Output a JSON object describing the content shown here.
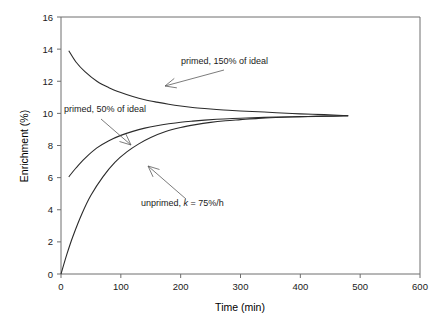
{
  "chart_data": {
    "type": "line",
    "title": "",
    "xlabel": "Time (min)",
    "ylabel": "Enrichment (%)",
    "xlim": [
      0,
      600
    ],
    "ylim": [
      0,
      16
    ],
    "xticks": [
      0,
      100,
      200,
      300,
      400,
      500,
      600
    ],
    "yticks": [
      0,
      2,
      4,
      6,
      8,
      10,
      12,
      14,
      16
    ],
    "xtick_labels": [
      "0",
      "100",
      "200",
      "300",
      "400",
      "500",
      "600"
    ],
    "ytick_labels": [
      "0",
      "2",
      "4",
      "6",
      "8",
      "10",
      "12",
      "14",
      "16"
    ],
    "grid": false,
    "legend": "none",
    "plateau": 9.85,
    "series": [
      {
        "name": "primed, 150% of ideal",
        "start_time": 13,
        "start_value": 13.9,
        "end_time": 480,
        "end_value": 9.85,
        "x": [
          13,
          25,
          40,
          60,
          80,
          100,
          120,
          140,
          160,
          180,
          200,
          220,
          240,
          260,
          280,
          300,
          330,
          360,
          400,
          440,
          480
        ],
        "y": [
          13.9,
          13.2,
          12.6,
          12.0,
          11.6,
          11.3,
          11.05,
          10.85,
          10.7,
          10.57,
          10.46,
          10.37,
          10.3,
          10.24,
          10.19,
          10.15,
          10.1,
          10.04,
          9.97,
          9.92,
          9.85
        ]
      },
      {
        "name": "primed, 50% of ideal",
        "start_time": 13,
        "start_value": 6.05,
        "end_time": 480,
        "end_value": 9.85,
        "x": [
          13,
          25,
          40,
          60,
          80,
          100,
          120,
          140,
          160,
          180,
          200,
          220,
          240,
          260,
          280,
          300,
          330,
          360,
          400,
          440,
          480
        ],
        "y": [
          6.05,
          6.6,
          7.2,
          7.85,
          8.3,
          8.63,
          8.88,
          9.08,
          9.23,
          9.35,
          9.45,
          9.52,
          9.58,
          9.63,
          9.67,
          9.7,
          9.74,
          9.77,
          9.8,
          9.83,
          9.85
        ]
      },
      {
        "name": "unprimed, k = 75%/h",
        "start_time": 0,
        "start_value": 0.0,
        "end_time": 480,
        "end_value": 9.85,
        "x": [
          0,
          10,
          20,
          35,
          50,
          70,
          90,
          110,
          130,
          150,
          175,
          200,
          225,
          250,
          275,
          300,
          330,
          360,
          400,
          440,
          480
        ],
        "y": [
          0.0,
          1.25,
          2.35,
          3.75,
          4.9,
          6.05,
          6.95,
          7.6,
          8.1,
          8.5,
          8.87,
          9.12,
          9.3,
          9.44,
          9.54,
          9.61,
          9.69,
          9.74,
          9.79,
          9.82,
          9.85
        ]
      }
    ],
    "annotations": [
      {
        "id": "annot-150",
        "text": "primed, 150% of ideal",
        "text_x": 181,
        "text_y": 64,
        "point_x": 165,
        "point_y": 86,
        "leader_from_x": 224,
        "leader_from_y": 70
      },
      {
        "id": "annot-50",
        "text": "primed, 50% of ideal",
        "text_x": 64,
        "text_y": 112,
        "point_x": 131,
        "point_y": 145,
        "leader_from_x": 101,
        "leader_from_y": 119
      },
      {
        "id": "annot-unprimed",
        "text_prefix": "unprimed, ",
        "text_italic": "k",
        "text_suffix": " = 75%/h",
        "text_x": 141,
        "text_y": 206,
        "point_x": 148,
        "point_y": 166,
        "leader_from_x": 186,
        "leader_from_y": 199
      }
    ]
  },
  "colors": {
    "curve": "#2b2b2b",
    "axis": "#6e6e6e",
    "text": "#1a1a1a",
    "leader": "#5a5a5a",
    "background": "#ffffff"
  }
}
